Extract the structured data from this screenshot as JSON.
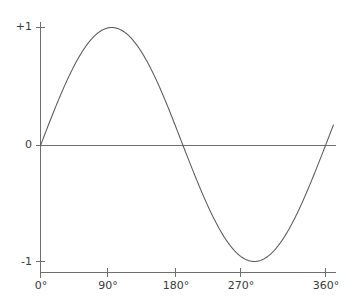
{
  "chart_data": {
    "type": "line",
    "title": "",
    "subtitle": "",
    "xlabel": "",
    "ylabel": "",
    "xlim": [
      0,
      360
    ],
    "ylim": [
      -1,
      1
    ],
    "grid": false,
    "legend": null,
    "x_unit": "degrees",
    "x_ticks": [
      "0°",
      "90°",
      "180°",
      "270°",
      "360°"
    ],
    "x_tick_values": [
      0,
      90,
      180,
      270,
      360
    ],
    "y_ticks": [
      "+1",
      "0",
      "-1"
    ],
    "y_tick_values": [
      1,
      0,
      -1
    ],
    "series": [
      {
        "name": "sine",
        "color": "#595959",
        "x": [
          0,
          10,
          20,
          30,
          40,
          50,
          60,
          70,
          80,
          90,
          100,
          110,
          120,
          130,
          140,
          150,
          160,
          170,
          180,
          190,
          200,
          210,
          220,
          230,
          240,
          250,
          260,
          270,
          280,
          290,
          300,
          310,
          320,
          330,
          340,
          350,
          360
        ],
        "values": [
          0,
          0.174,
          0.342,
          0.5,
          0.643,
          0.766,
          0.866,
          0.94,
          0.985,
          1,
          0.985,
          0.94,
          0.866,
          0.766,
          0.643,
          0.5,
          0.342,
          0.174,
          0,
          -0.174,
          -0.342,
          -0.5,
          -0.643,
          -0.766,
          -0.866,
          -0.94,
          -0.985,
          -1,
          -0.985,
          -0.94,
          -0.866,
          -0.766,
          -0.643,
          -0.5,
          -0.342,
          -0.174,
          0
        ]
      }
    ],
    "annotations": []
  },
  "axes": {
    "y_axis_color": "#6e6e6e",
    "x_axis_color": "#6e6e6e",
    "zero_line_color": "#6e6e6e",
    "curve_color": "#595959",
    "tick_label_color": "#3a3a3a"
  },
  "labels": {
    "y": [
      {
        "text": "+1",
        "value": 1
      },
      {
        "text": "0",
        "value": 0
      },
      {
        "text": "-1",
        "value": -1
      }
    ],
    "x": [
      {
        "text": "0°",
        "value": 0
      },
      {
        "text": "90°",
        "value": 90
      },
      {
        "text": "180°",
        "value": 180
      },
      {
        "text": "270°",
        "value": 270
      },
      {
        "text": "360°",
        "value": 360
      }
    ]
  }
}
